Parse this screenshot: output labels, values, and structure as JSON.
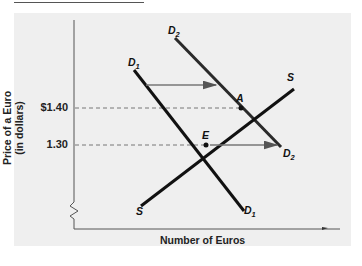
{
  "diagram": {
    "y_axis_label": "Price of a Euro\n(in dollars)",
    "y_axis_label_line1": "Price of a Euro",
    "y_axis_label_line2": "(in dollars)",
    "x_axis_label": "Number of Euros",
    "y_ticks": [
      {
        "label": "$1.40",
        "value": 1.4
      },
      {
        "label": "1.30",
        "value": 1.3
      }
    ],
    "curves": [
      {
        "id": "D1",
        "name": "D",
        "subscript": "1",
        "type": "demand",
        "color": "#111111"
      },
      {
        "id": "D2",
        "name": "D",
        "subscript": "2",
        "type": "demand",
        "color": "#333333"
      },
      {
        "id": "S",
        "name": "S",
        "subscript": "",
        "type": "supply",
        "color": "#111111"
      }
    ],
    "points": [
      {
        "label": "E",
        "description": "initial equilibrium",
        "price": "1.30"
      },
      {
        "label": "A",
        "description": "new equilibrium",
        "price": "$1.40"
      }
    ],
    "shift_arrows": [
      {
        "description": "demand shift right from D1 to D2 (upper)"
      },
      {
        "description": "demand shift right from D1 to D2 (at 1.30)"
      }
    ],
    "axis_break": "zigzag on vertical axis",
    "colors": {
      "panel_bg": "#efefef",
      "line": "#111111",
      "dashed": "#777777",
      "arrow": "#666666"
    }
  }
}
